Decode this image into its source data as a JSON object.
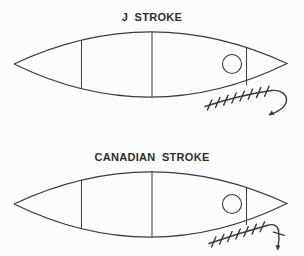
{
  "canvas": {
    "background": "#fcfcfc",
    "line_color": "#3a3a3a"
  },
  "figures": [
    {
      "title": "J STROKE",
      "diagram": "canoe-top-view-with-paddle-stroke",
      "hatch_marks": 8,
      "stroke_end": "hook-curling-back"
    },
    {
      "title": "CANADIAN STROKE",
      "diagram": "canoe-top-view-with-paddle-stroke",
      "hatch_marks": 7,
      "stroke_end": "arrow-slicing-down"
    }
  ]
}
